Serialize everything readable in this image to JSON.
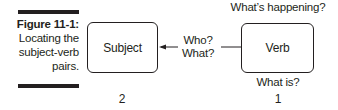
{
  "figure": {
    "label": "Figure 11-1:",
    "caption_lines": [
      "Locating the",
      "subject-verb",
      "pairs."
    ]
  },
  "diagram": {
    "nodes": [
      {
        "id": "subject",
        "label": "Subject",
        "order": "2"
      },
      {
        "id": "verb",
        "label": "Verb",
        "order": "1"
      }
    ],
    "edge": {
      "from": "verb",
      "to": "subject",
      "label_lines": [
        "Who?",
        "What?"
      ]
    },
    "verb_annotations": {
      "above": "What’s happening?",
      "below": "What is?"
    }
  },
  "colors": {
    "ink": "#231f20",
    "background": "#ffffff"
  }
}
